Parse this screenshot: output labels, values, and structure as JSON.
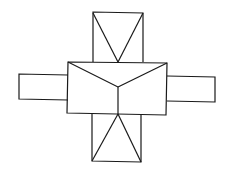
{
  "diagram": {
    "stroke_color": "#1a1a1a",
    "background": "#ffffff",
    "shapes": {
      "center_box": {
        "points": [
          [
            68,
            62
          ],
          [
            167,
            63
          ],
          [
            166,
            115
          ],
          [
            67,
            113
          ]
        ]
      },
      "center_roof_lines": [
        [
          [
            68,
            62
          ],
          [
            118,
            87
          ]
        ],
        [
          [
            167,
            63
          ],
          [
            118,
            87
          ]
        ],
        [
          [
            118,
            87
          ],
          [
            118,
            114
          ]
        ]
      ],
      "top_wing": {
        "points": [
          [
            93,
            12
          ],
          [
            143,
            13
          ],
          [
            143,
            62
          ],
          [
            93,
            62
          ]
        ],
        "apex": [
          118,
          62
        ]
      },
      "bottom_wing": {
        "points": [
          [
            92,
            114
          ],
          [
            141,
            115
          ],
          [
            141,
            162
          ],
          [
            92,
            161
          ]
        ],
        "apex": [
          118,
          114
        ]
      },
      "left_wing": {
        "points": [
          [
            19,
            74
          ],
          [
            68,
            75
          ],
          [
            68,
            100
          ],
          [
            19,
            99
          ]
        ]
      },
      "right_wing": {
        "points": [
          [
            167,
            76
          ],
          [
            215,
            77
          ],
          [
            215,
            102
          ],
          [
            167,
            101
          ]
        ]
      }
    }
  }
}
